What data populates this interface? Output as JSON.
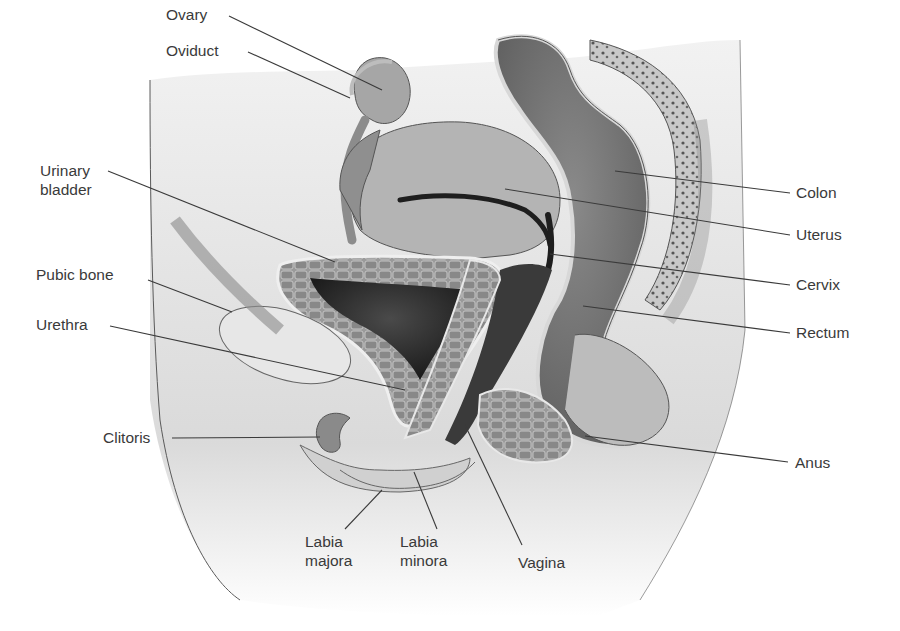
{
  "figure": {
    "colors": {
      "background": "#ffffff",
      "body": "#d9d9d9",
      "body_light": "#ececec",
      "tissue_mid": "#a8a8a8",
      "tissue_dark": "#6e6e6e",
      "lumen": "#2a2a2a",
      "label_text": "#3a3a3a"
    }
  },
  "labels": [
    {
      "id": "ovary",
      "text": [
        "Ovary"
      ],
      "x": 166,
      "y": 20,
      "anchor": "start",
      "line": [
        [
          229,
          16
        ],
        [
          382,
          90
        ]
      ]
    },
    {
      "id": "oviduct",
      "text": [
        "Oviduct"
      ],
      "x": 166,
      "y": 56,
      "anchor": "start",
      "line": [
        [
          248,
          52
        ],
        [
          350,
          98
        ]
      ]
    },
    {
      "id": "urinary-bladder",
      "text": [
        "Urinary",
        "bladder"
      ],
      "x": 40,
      "y": 176,
      "anchor": "start",
      "line": [
        [
          108,
          171
        ],
        [
          335,
          262
        ]
      ]
    },
    {
      "id": "pubic-bone",
      "text": [
        "Pubic bone"
      ],
      "x": 36,
      "y": 280,
      "anchor": "start",
      "line": [
        [
          148,
          280
        ],
        [
          232,
          312
        ]
      ]
    },
    {
      "id": "urethra",
      "text": [
        "Urethra"
      ],
      "x": 36,
      "y": 330,
      "anchor": "start",
      "line": [
        [
          110,
          326
        ],
        [
          405,
          390
        ]
      ]
    },
    {
      "id": "clitoris",
      "text": [
        "Clitoris"
      ],
      "x": 103,
      "y": 443,
      "anchor": "start",
      "line": [
        [
          172,
          438
        ],
        [
          320,
          437
        ]
      ]
    },
    {
      "id": "colon",
      "text": [
        "Colon"
      ],
      "x": 796,
      "y": 198,
      "anchor": "start",
      "line": [
        [
          790,
          193
        ],
        [
          615,
          171
        ]
      ]
    },
    {
      "id": "uterus",
      "text": [
        "Uterus"
      ],
      "x": 796,
      "y": 240,
      "anchor": "start",
      "line": [
        [
          790,
          235
        ],
        [
          505,
          189
        ]
      ]
    },
    {
      "id": "cervix",
      "text": [
        "Cervix"
      ],
      "x": 796,
      "y": 290,
      "anchor": "start",
      "line": [
        [
          790,
          285
        ],
        [
          550,
          254
        ]
      ]
    },
    {
      "id": "rectum",
      "text": [
        "Rectum"
      ],
      "x": 796,
      "y": 338,
      "anchor": "start",
      "line": [
        [
          790,
          333
        ],
        [
          583,
          306
        ]
      ]
    },
    {
      "id": "anus",
      "text": [
        "Anus"
      ],
      "x": 795,
      "y": 468,
      "anchor": "start",
      "line": [
        [
          788,
          462
        ],
        [
          585,
          436
        ]
      ]
    },
    {
      "id": "labia-majora",
      "text": [
        "Labia",
        "majora"
      ],
      "x": 305,
      "y": 547,
      "anchor": "start",
      "line": [
        [
          345,
          529
        ],
        [
          382,
          490
        ]
      ]
    },
    {
      "id": "labia-minora",
      "text": [
        "Labia",
        "minora"
      ],
      "x": 400,
      "y": 547,
      "anchor": "start",
      "line": [
        [
          437,
          529
        ],
        [
          414,
          472
        ]
      ]
    },
    {
      "id": "vagina",
      "text": [
        "Vagina"
      ],
      "x": 518,
      "y": 568,
      "anchor": "start",
      "line": [
        [
          522,
          545
        ],
        [
          465,
          425
        ]
      ]
    }
  ]
}
